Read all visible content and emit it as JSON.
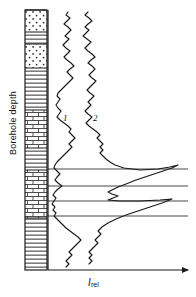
{
  "figure": {
    "type": "well-log",
    "background": "#ffffff",
    "ink": "#1a1a1a",
    "width": 196,
    "height": 297
  },
  "axes": {
    "y_label": "Borehole depth",
    "x_label_symbol": "I",
    "x_label_subscript": "rel",
    "x_axis_y": 270,
    "x_axis_x0": 48,
    "x_axis_x1": 188,
    "x_axis_arrow": true,
    "y_axis_x": 48,
    "y_axis_y0": 10,
    "y_axis_y1": 270
  },
  "lithology_column": {
    "x": 25,
    "width": 22,
    "top": 10,
    "bottom": 270,
    "border_color": "#1a1a1a",
    "beds": [
      {
        "name": "sandstone",
        "pattern": "dots",
        "top": 10,
        "height": 22
      },
      {
        "name": "shale",
        "pattern": "lines",
        "top": 32,
        "height": 12
      },
      {
        "name": "sandstone",
        "pattern": "dots",
        "top": 44,
        "height": 24
      },
      {
        "name": "shale",
        "pattern": "lines",
        "top": 68,
        "height": 42
      },
      {
        "name": "limestone",
        "pattern": "bricks",
        "top": 110,
        "height": 38
      },
      {
        "name": "shale",
        "pattern": "lines",
        "top": 148,
        "height": 22
      },
      {
        "name": "limestone",
        "pattern": "bricks",
        "top": 170,
        "height": 48
      },
      {
        "name": "shale",
        "pattern": "lines",
        "top": 218,
        "height": 52
      }
    ]
  },
  "marker_lines": {
    "color": "#1a1a1a",
    "x_start": 48,
    "x_end": 188,
    "depths": [
      169,
      186,
      201,
      216
    ]
  },
  "chart_data": {
    "type": "line",
    "title": "",
    "xlabel": "I_rel",
    "ylabel": "Borehole depth",
    "orientation": "vertical-depth",
    "grid": false,
    "legend": [
      "1",
      "2"
    ],
    "legend_position": "inline-annotation",
    "annotations": [
      {
        "text": "1",
        "x": 63,
        "y": 117
      },
      {
        "text": "2",
        "x": 93,
        "y": 117
      }
    ],
    "series": [
      {
        "name": "1",
        "label": "1",
        "color": "#1a1a1a",
        "points": [
          [
            68,
            12
          ],
          [
            66,
            15
          ],
          [
            70,
            18
          ],
          [
            67,
            21
          ],
          [
            64,
            24
          ],
          [
            68,
            27
          ],
          [
            71,
            30
          ],
          [
            68,
            33
          ],
          [
            65,
            36
          ],
          [
            69,
            39
          ],
          [
            66,
            42
          ],
          [
            63,
            45
          ],
          [
            66,
            48
          ],
          [
            70,
            51
          ],
          [
            67,
            54
          ],
          [
            64,
            57
          ],
          [
            67,
            60
          ],
          [
            71,
            63
          ],
          [
            74,
            66
          ],
          [
            70,
            69
          ],
          [
            67,
            72
          ],
          [
            70,
            75
          ],
          [
            73,
            78
          ],
          [
            70,
            81
          ],
          [
            67,
            84
          ],
          [
            64,
            87
          ],
          [
            61,
            90
          ],
          [
            58,
            93
          ],
          [
            57,
            96
          ],
          [
            60,
            99
          ],
          [
            58,
            102
          ],
          [
            56,
            105
          ],
          [
            58,
            108
          ],
          [
            61,
            111
          ],
          [
            59,
            114
          ],
          [
            57,
            117
          ],
          [
            60,
            120
          ],
          [
            64,
            123
          ],
          [
            68,
            126
          ],
          [
            71,
            129
          ],
          [
            69,
            132
          ],
          [
            72,
            135
          ],
          [
            75,
            138
          ],
          [
            72,
            141
          ],
          [
            69,
            144
          ],
          [
            72,
            147
          ],
          [
            69,
            150
          ],
          [
            66,
            153
          ],
          [
            63,
            156
          ],
          [
            60,
            159
          ],
          [
            57,
            162
          ],
          [
            55,
            165
          ],
          [
            54,
            168
          ],
          [
            57,
            171
          ],
          [
            60,
            174
          ],
          [
            57,
            177
          ],
          [
            55,
            180
          ],
          [
            58,
            183
          ],
          [
            62,
            186
          ],
          [
            58,
            189
          ],
          [
            55,
            192
          ],
          [
            53,
            195
          ],
          [
            56,
            198
          ],
          [
            54,
            201
          ],
          [
            52,
            204
          ],
          [
            55,
            207
          ],
          [
            53,
            210
          ],
          [
            56,
            213
          ],
          [
            54,
            216
          ],
          [
            57,
            219
          ],
          [
            60,
            222
          ],
          [
            63,
            225
          ],
          [
            66,
            228
          ],
          [
            70,
            231
          ],
          [
            74,
            234
          ],
          [
            78,
            237
          ],
          [
            81,
            240
          ],
          [
            78,
            243
          ],
          [
            75,
            246
          ],
          [
            72,
            249
          ],
          [
            69,
            252
          ],
          [
            72,
            255
          ],
          [
            69,
            258
          ],
          [
            66,
            261
          ],
          [
            69,
            264
          ],
          [
            66,
            267
          ]
        ]
      },
      {
        "name": "2",
        "label": "2",
        "color": "#1a1a1a",
        "points": [
          [
            88,
            12
          ],
          [
            85,
            15
          ],
          [
            89,
            18
          ],
          [
            92,
            21
          ],
          [
            88,
            24
          ],
          [
            85,
            27
          ],
          [
            89,
            30
          ],
          [
            86,
            33
          ],
          [
            83,
            36
          ],
          [
            87,
            39
          ],
          [
            91,
            42
          ],
          [
            88,
            45
          ],
          [
            85,
            48
          ],
          [
            88,
            51
          ],
          [
            92,
            54
          ],
          [
            95,
            57
          ],
          [
            91,
            60
          ],
          [
            88,
            63
          ],
          [
            92,
            66
          ],
          [
            95,
            69
          ],
          [
            92,
            72
          ],
          [
            89,
            75
          ],
          [
            92,
            78
          ],
          [
            96,
            81
          ],
          [
            93,
            84
          ],
          [
            90,
            87
          ],
          [
            87,
            90
          ],
          [
            90,
            93
          ],
          [
            94,
            96
          ],
          [
            91,
            99
          ],
          [
            88,
            102
          ],
          [
            91,
            105
          ],
          [
            88,
            108
          ],
          [
            85,
            111
          ],
          [
            88,
            114
          ],
          [
            92,
            117
          ],
          [
            89,
            120
          ],
          [
            86,
            123
          ],
          [
            89,
            126
          ],
          [
            93,
            129
          ],
          [
            97,
            132
          ],
          [
            100,
            135
          ],
          [
            97,
            138
          ],
          [
            100,
            141
          ],
          [
            103,
            144
          ],
          [
            100,
            147
          ],
          [
            103,
            150
          ],
          [
            100,
            153
          ],
          [
            103,
            156
          ],
          [
            106,
            159
          ],
          [
            110,
            162
          ],
          [
            115,
            165
          ],
          [
            124,
            168
          ],
          [
            140,
            170
          ],
          [
            158,
            169
          ],
          [
            170,
            167
          ],
          [
            178,
            165
          ],
          [
            172,
            168
          ],
          [
            160,
            172
          ],
          [
            148,
            176
          ],
          [
            136,
            180
          ],
          [
            126,
            184
          ],
          [
            118,
            187
          ],
          [
            112,
            190
          ],
          [
            108,
            192
          ],
          [
            112,
            194
          ],
          [
            118,
            196
          ],
          [
            113,
            198
          ],
          [
            108,
            200
          ],
          [
            120,
            201
          ],
          [
            140,
            201
          ],
          [
            160,
            200
          ],
          [
            172,
            199
          ],
          [
            162,
            203
          ],
          [
            150,
            207
          ],
          [
            138,
            211
          ],
          [
            126,
            215
          ],
          [
            116,
            219
          ],
          [
            108,
            223
          ],
          [
            102,
            227
          ],
          [
            98,
            231
          ],
          [
            101,
            234
          ],
          [
            98,
            237
          ],
          [
            95,
            240
          ],
          [
            98,
            243
          ],
          [
            95,
            246
          ],
          [
            92,
            249
          ],
          [
            89,
            252
          ],
          [
            92,
            255
          ],
          [
            89,
            258
          ],
          [
            92,
            261
          ],
          [
            89,
            264
          ]
        ]
      }
    ]
  }
}
